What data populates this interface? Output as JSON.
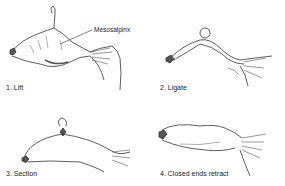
{
  "figure": {
    "panels": [
      {
        "id": 1,
        "label": "1. Lift",
        "callout": "Mesosalpinx"
      },
      {
        "id": 2,
        "label": "2. Ligate"
      },
      {
        "id": 3,
        "label": "3. Section"
      },
      {
        "id": 4,
        "label": "4. Closed ends retract"
      }
    ]
  }
}
